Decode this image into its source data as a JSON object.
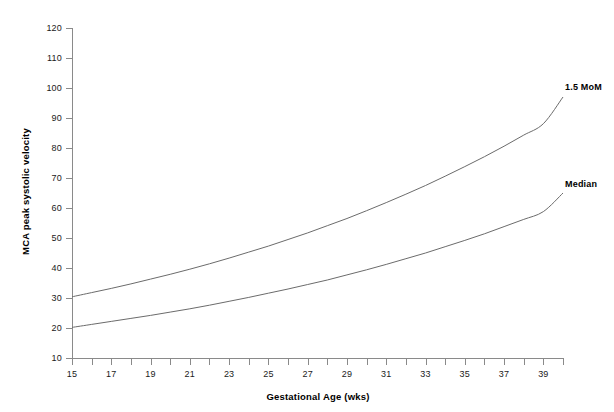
{
  "chart_data": {
    "type": "line",
    "title": "",
    "xlabel": "Gestational Age (wks)",
    "ylabel": "MCA peak systolic velocity",
    "xlim": [
      14,
      40.5
    ],
    "ylim": [
      10,
      120
    ],
    "grid": false,
    "legend_position": "right-inline",
    "x_ticks": [
      15,
      16,
      17,
      18,
      19,
      20,
      21,
      22,
      23,
      24,
      25,
      26,
      27,
      28,
      29,
      30,
      31,
      32,
      33,
      34,
      35,
      36,
      37,
      38,
      39,
      40
    ],
    "x_tick_labels": [
      "15",
      "",
      "17",
      "",
      "19",
      "",
      "21",
      "",
      "23",
      "",
      "25",
      "",
      "27",
      "",
      "29",
      "",
      "31",
      "",
      "33",
      "",
      "35",
      "",
      "37",
      "",
      "39",
      ""
    ],
    "y_ticks": [
      10,
      20,
      30,
      40,
      50,
      60,
      70,
      80,
      90,
      100,
      110,
      120
    ],
    "y_tick_labels": [
      "10",
      "20",
      "30",
      "40",
      "50",
      "60",
      "70",
      "80",
      "90",
      "100",
      "110",
      "120"
    ],
    "x": [
      15,
      16,
      17,
      18,
      19,
      20,
      21,
      22,
      23,
      24,
      25,
      26,
      27,
      28,
      29,
      30,
      31,
      32,
      33,
      34,
      35,
      36,
      37,
      38,
      39,
      40
    ],
    "series": [
      {
        "name": "1.5 MoM",
        "color": "#6b6b6b",
        "values": [
          30.4,
          31.8,
          33.2,
          34.7,
          36.3,
          37.9,
          39.6,
          41.4,
          43.3,
          45.3,
          47.3,
          49.5,
          51.7,
          54.1,
          56.5,
          59.1,
          61.8,
          64.6,
          67.5,
          70.6,
          73.8,
          77.1,
          80.6,
          84.3,
          88.1,
          97.0
        ]
      },
      {
        "name": "Median",
        "color": "#6b6b6b",
        "values": [
          20.2,
          21.2,
          22.2,
          23.2,
          24.2,
          25.3,
          26.4,
          27.6,
          28.9,
          30.2,
          31.6,
          33.0,
          34.5,
          36.0,
          37.7,
          39.4,
          41.2,
          43.1,
          45.0,
          47.1,
          49.2,
          51.4,
          53.8,
          56.2,
          58.8,
          65.0
        ]
      }
    ],
    "annotations": [
      {
        "text": "1.5 MoM",
        "anchor_series": "1.5 MoM"
      },
      {
        "text": "Median",
        "anchor_series": "Median"
      }
    ]
  },
  "axis_color": "#8a8a8a",
  "line_color": "#6b6b6b",
  "background": "#ffffff"
}
